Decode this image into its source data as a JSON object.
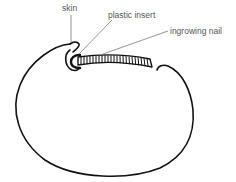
{
  "diagram": {
    "labels": {
      "skin": "skin",
      "plastic_insert": "plastic insert",
      "ingrowing_nail": "ingrowing nail"
    },
    "colors": {
      "outline": "#111111",
      "leader_lines": "#777777",
      "label_text": "#555555",
      "background": "#ffffff"
    }
  }
}
